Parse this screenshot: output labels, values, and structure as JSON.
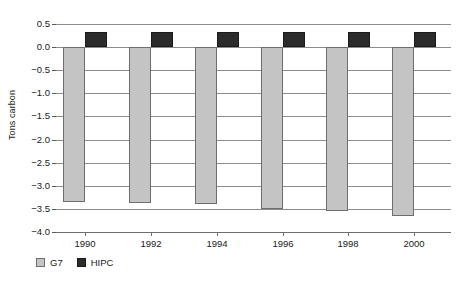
{
  "chart_data": {
    "type": "bar",
    "title": "",
    "xlabel": "",
    "ylabel": "Tons carbon",
    "categories": [
      "1990",
      "1992",
      "1994",
      "1996",
      "1998",
      "2000"
    ],
    "series": [
      {
        "name": "G7",
        "values": [
          -3.35,
          -3.38,
          -3.4,
          -3.5,
          -3.55,
          -3.65
        ]
      },
      {
        "name": "HIPC",
        "values": [
          0.33,
          0.33,
          0.33,
          0.33,
          0.33,
          0.33
        ]
      }
    ],
    "ylim": [
      -4.0,
      0.5
    ],
    "yticks": [
      "0.5",
      "0.0",
      "-0.5",
      "-1.0",
      "-1.5",
      "-2.0",
      "-2.5",
      "-3.0",
      "-3.5",
      "-4.0"
    ],
    "grid": true,
    "legend_position": "bottom-left",
    "colors": {
      "G7": "#c4c4c4",
      "HIPC": "#2b2b2b",
      "grid": "#8c8c8c",
      "axis": "#6e6e6e"
    }
  },
  "legend": {
    "items": [
      {
        "label": "G7"
      },
      {
        "label": "HIPC"
      }
    ]
  }
}
